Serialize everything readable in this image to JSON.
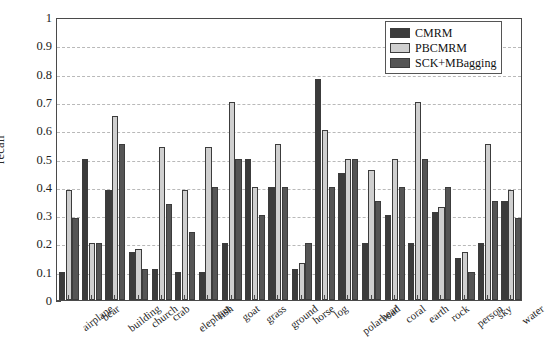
{
  "chart_data": {
    "type": "bar",
    "title": "",
    "xlabel": "",
    "ylabel": "recall",
    "ylim": [
      0,
      1
    ],
    "ytick_labels": [
      "0",
      "0.1",
      "0.2",
      "0.3",
      "0.4",
      "0.5",
      "0.6",
      "0.7",
      "0.8",
      "0.9",
      "1"
    ],
    "ytick_values": [
      0,
      0.1,
      0.2,
      0.3,
      0.4,
      0.5,
      0.6,
      0.7,
      0.8,
      0.9,
      1
    ],
    "grid": "horizontal-dashed",
    "legend_position": "top-right",
    "categories": [
      "airplane",
      "bear",
      "building",
      "church",
      "crab",
      "elephant",
      "fish",
      "goat",
      "grass",
      "ground",
      "horse",
      "log",
      "polarbear",
      "road",
      "coral",
      "earth",
      "rock",
      "person",
      "sky",
      "water"
    ],
    "series": [
      {
        "name": "CMRM",
        "color": "#3b3b3b",
        "values": [
          0.1,
          0.5,
          0.39,
          0.17,
          0.11,
          0.1,
          0.1,
          0.2,
          0.5,
          0.4,
          0.11,
          0.78,
          0.45,
          0.2,
          0.3,
          0.2,
          0.31,
          0.15,
          0.2,
          0.35
        ]
      },
      {
        "name": "PBCMRM",
        "color": "#cfcfcf",
        "values": [
          0.39,
          0.2,
          0.65,
          0.18,
          0.54,
          0.39,
          0.54,
          0.7,
          0.4,
          0.55,
          0.13,
          0.6,
          0.5,
          0.46,
          0.5,
          0.7,
          0.33,
          0.17,
          0.55,
          0.39
        ]
      },
      {
        "name": "SCK+MBagging",
        "color": "#555555",
        "values": [
          0.29,
          0.2,
          0.55,
          0.11,
          0.34,
          0.24,
          0.4,
          0.5,
          0.3,
          0.4,
          0.2,
          0.4,
          0.5,
          0.35,
          0.4,
          0.5,
          0.4,
          0.1,
          0.35,
          0.29
        ]
      }
    ]
  },
  "legend": {
    "entries": [
      {
        "label": "CMRM"
      },
      {
        "label": "PBCMRM"
      },
      {
        "label": "SCK+MBagging"
      }
    ]
  }
}
